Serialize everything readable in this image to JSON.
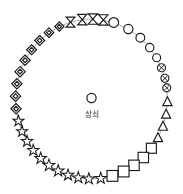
{
  "diagram": {
    "title": "",
    "background_color": "#ffffff",
    "line_color": "#8a8a8a",
    "symbol_stroke_color": "#1a1a1a",
    "symbol_fill_color": "#ffffff",
    "center": {
      "icon": "circle-icon",
      "label": "상쇠",
      "cx": 91.5,
      "cy": 100,
      "icon_cy": 98,
      "icon_r": 4.6,
      "label_cy": 115
    },
    "ring": {
      "cx": 91.5,
      "cy": 99,
      "rx": 76,
      "ry": 80,
      "shape": "ellipse"
    },
    "groups": [
      {
        "name": "circle-group",
        "icon": "circle-icon",
        "count": 6
      },
      {
        "name": "circled-x-group",
        "icon": "circled-x-icon",
        "count": 3
      },
      {
        "name": "triangle-group",
        "icon": "triangle-icon",
        "count": 5
      },
      {
        "name": "square-group",
        "icon": "square-icon",
        "count": 5
      },
      {
        "name": "star-group",
        "icon": "star-icon",
        "count": 11
      },
      {
        "name": "nested-diamond-group",
        "icon": "nested-diamond-icon",
        "count": 9
      },
      {
        "name": "bowtie-group",
        "icon": "bowtie-icon",
        "count": 4
      }
    ],
    "nodes": [
      {
        "name": "node-1",
        "icon": "circle-icon",
        "angle_deg": -85,
        "size": 4.9
      },
      {
        "name": "node-2",
        "icon": "circle-icon",
        "angle_deg": -73,
        "size": 4.9
      },
      {
        "name": "node-3",
        "icon": "circle-icon",
        "angle_deg": -61,
        "size": 4.6
      },
      {
        "name": "node-4",
        "icon": "circle-icon",
        "angle_deg": -50,
        "size": 4.4
      },
      {
        "name": "node-5",
        "icon": "circle-icon",
        "angle_deg": -40,
        "size": 4.2
      },
      {
        "name": "node-6",
        "icon": "circle-icon",
        "angle_deg": -31,
        "size": 4.0
      },
      {
        "name": "node-7",
        "icon": "circled-x-icon",
        "angle_deg": -23,
        "size": 4.0
      },
      {
        "name": "node-8",
        "icon": "circled-x-icon",
        "angle_deg": -15,
        "size": 4.0
      },
      {
        "name": "node-9",
        "icon": "circled-x-icon",
        "angle_deg": -8,
        "size": 4.0
      },
      {
        "name": "node-10",
        "icon": "triangle-icon",
        "angle_deg": 2,
        "size": 5.0
      },
      {
        "name": "node-11",
        "icon": "triangle-icon",
        "angle_deg": 11,
        "size": 5.0
      },
      {
        "name": "node-12",
        "icon": "triangle-icon",
        "angle_deg": 20,
        "size": 5.0
      },
      {
        "name": "node-13",
        "icon": "triangle-icon",
        "angle_deg": 29,
        "size": 5.0
      },
      {
        "name": "node-14",
        "icon": "square-icon",
        "angle_deg": 38,
        "size": 5.0
      },
      {
        "name": "node-15",
        "icon": "square-icon",
        "angle_deg": 47,
        "size": 5.2
      },
      {
        "name": "node-16",
        "icon": "square-icon",
        "angle_deg": 56,
        "size": 5.2
      },
      {
        "name": "node-17",
        "icon": "square-icon",
        "angle_deg": 65,
        "size": 5.4
      },
      {
        "name": "node-18",
        "icon": "square-icon",
        "angle_deg": 74,
        "size": 5.4
      },
      {
        "name": "node-19",
        "icon": "star-icon",
        "angle_deg": 83,
        "size": 6.0
      },
      {
        "name": "node-20",
        "icon": "star-icon",
        "angle_deg": 92,
        "size": 6.0
      },
      {
        "name": "node-21",
        "icon": "star-icon",
        "angle_deg": 100,
        "size": 6.0
      },
      {
        "name": "node-22",
        "icon": "star-icon",
        "angle_deg": 108,
        "size": 6.0
      },
      {
        "name": "node-23",
        "icon": "star-icon",
        "angle_deg": 116,
        "size": 6.2
      },
      {
        "name": "node-24",
        "icon": "star-icon",
        "angle_deg": 124,
        "size": 6.2
      },
      {
        "name": "node-25",
        "icon": "star-icon",
        "angle_deg": 132,
        "size": 6.2
      },
      {
        "name": "node-26",
        "icon": "star-icon",
        "angle_deg": 140,
        "size": 6.0
      },
      {
        "name": "node-27",
        "icon": "star-icon",
        "angle_deg": 148,
        "size": 6.0
      },
      {
        "name": "node-28",
        "icon": "star-icon",
        "angle_deg": 156,
        "size": 5.8
      },
      {
        "name": "node-29",
        "icon": "star-icon",
        "angle_deg": 164,
        "size": 5.8
      },
      {
        "name": "node-30",
        "icon": "nested-diamond-icon",
        "angle_deg": 173,
        "size": 5.2
      },
      {
        "name": "node-31",
        "icon": "nested-diamond-icon",
        "angle_deg": 182,
        "size": 5.2
      },
      {
        "name": "node-32",
        "icon": "nested-diamond-icon",
        "angle_deg": 191,
        "size": 5.2
      },
      {
        "name": "node-33",
        "icon": "nested-diamond-icon",
        "angle_deg": 200,
        "size": 5.2
      },
      {
        "name": "node-34",
        "icon": "nested-diamond-icon",
        "angle_deg": 209,
        "size": 5.2
      },
      {
        "name": "node-35",
        "icon": "nested-diamond-icon",
        "angle_deg": 218,
        "size": 5.0
      },
      {
        "name": "node-36",
        "icon": "nested-diamond-icon",
        "angle_deg": 227,
        "size": 5.0
      },
      {
        "name": "node-37",
        "icon": "nested-diamond-icon",
        "angle_deg": 236,
        "size": 4.8
      },
      {
        "name": "node-38",
        "icon": "nested-diamond-icon",
        "angle_deg": 245,
        "size": 4.6
      },
      {
        "name": "node-39",
        "icon": "bowtie-icon",
        "angle_deg": 254,
        "size": 5.0
      },
      {
        "name": "node-40",
        "icon": "bowtie-icon",
        "angle_deg": 263,
        "size": 5.2
      },
      {
        "name": "node-41",
        "icon": "bowtie-icon",
        "angle_deg": 271,
        "size": 5.2
      },
      {
        "name": "node-42",
        "icon": "bowtie-icon",
        "angle_deg": 279,
        "size": 5.2
      }
    ]
  }
}
